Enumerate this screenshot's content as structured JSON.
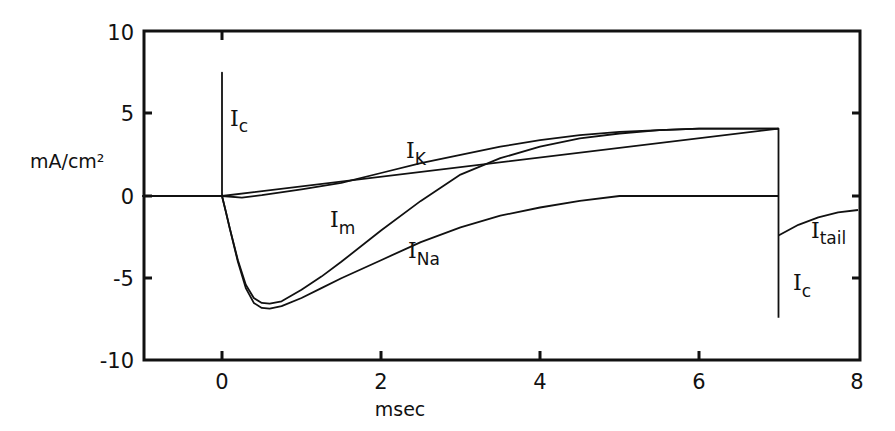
{
  "chart_data": {
    "type": "line",
    "title": "",
    "xlabel": "msec",
    "ylabel": "mA/cm²",
    "xlim": [
      -1,
      8
    ],
    "ylim": [
      -10,
      10
    ],
    "grid": false,
    "legend": "none (curves labeled inline)",
    "x_ticks": [
      0,
      2,
      4,
      6,
      8
    ],
    "x_tick_labels": [
      "0",
      "2",
      "4",
      "6",
      "8"
    ],
    "y_ticks": [
      -10,
      -5,
      0,
      5,
      10
    ],
    "y_tick_labels": [
      "-10",
      "-5",
      "0",
      "5",
      "10"
    ],
    "series": [
      {
        "name": "I_K",
        "label_main": "I",
        "label_sub": "K",
        "x": [
          -1,
          0,
          0.25,
          0.5,
          1,
          1.5,
          2,
          2.5,
          3,
          3.5,
          4,
          4.5,
          5,
          5.5,
          6,
          7
        ],
        "values": [
          0,
          0,
          -0.1,
          0.05,
          0.4,
          0.8,
          1.4,
          2.0,
          2.5,
          3.0,
          3.4,
          3.7,
          3.9,
          4.0,
          4.1,
          4.1
        ]
      },
      {
        "name": "I_Na",
        "label_main": "I",
        "label_sub": "Na",
        "x": [
          -1,
          0,
          0.05,
          0.1,
          0.2,
          0.3,
          0.4,
          0.5,
          0.6,
          0.75,
          1,
          1.25,
          1.5,
          2,
          2.5,
          3,
          3.5,
          4,
          4.5,
          5,
          6,
          7
        ],
        "values": [
          0,
          0,
          -1.0,
          -2.0,
          -4.0,
          -5.6,
          -6.5,
          -6.8,
          -6.85,
          -6.7,
          -6.2,
          -5.6,
          -5.0,
          -3.9,
          -2.8,
          -1.9,
          -1.2,
          -0.7,
          -0.3,
          0,
          0,
          0
        ]
      },
      {
        "name": "I_m",
        "label_main": "I",
        "label_sub": "m",
        "x": [
          -1,
          0,
          0.05,
          0.1,
          0.2,
          0.3,
          0.4,
          0.5,
          0.6,
          0.75,
          1,
          1.25,
          1.5,
          2,
          2.5,
          3,
          3.5,
          4,
          4.5,
          5,
          5.5,
          6,
          7
        ],
        "values": [
          0,
          0,
          -1.0,
          -2.0,
          -3.9,
          -5.4,
          -6.2,
          -6.5,
          -6.55,
          -6.4,
          -5.7,
          -4.9,
          -4.0,
          -2.1,
          -0.3,
          1.3,
          2.3,
          3.0,
          3.5,
          3.8,
          4.0,
          4.1,
          4.1
        ]
      },
      {
        "name": "I_c",
        "label_main": "I",
        "label_sub": "c",
        "x": [
          0,
          0,
          0,
          7,
          7
        ],
        "values": [
          0,
          7.5,
          0,
          4.1,
          -7.4
        ],
        "note": "capacitive transients: upward spike to ~7.5 at t=0, downward spike to ~-7.4 at t=7"
      },
      {
        "name": "I_tail",
        "label_main": "I",
        "label_sub": "tail",
        "x": [
          7,
          7.25,
          7.5,
          7.75,
          8
        ],
        "values": [
          -2.4,
          -1.75,
          -1.3,
          -1.0,
          -0.85
        ]
      }
    ],
    "annotations": [
      {
        "text": "I_c",
        "near": [
          0.15,
          4.6
        ]
      },
      {
        "text": "I_K",
        "near": [
          2.1,
          2.3
        ]
      },
      {
        "text": "I_m",
        "near": [
          1.4,
          -1.6
        ]
      },
      {
        "text": "I_Na",
        "near": [
          2.3,
          -3.5
        ]
      },
      {
        "text": "I_tail",
        "near": [
          7.5,
          -1.6
        ]
      },
      {
        "text": "I_c",
        "near": [
          7.2,
          -5.9
        ]
      }
    ]
  },
  "axes": {
    "x_title": "msec",
    "y_title": "mA/cm²",
    "x_tick_labels": [
      "0",
      "2",
      "4",
      "6",
      "8"
    ],
    "y_tick_labels": [
      "10",
      "5",
      "0",
      "-5",
      "-10"
    ]
  },
  "labels": {
    "ic_top": {
      "main": "I",
      "sub": "c"
    },
    "ik": {
      "main": "I",
      "sub": "K"
    },
    "im": {
      "main": "I",
      "sub": "m"
    },
    "ina": {
      "main": "I",
      "sub": "Na"
    },
    "itail": {
      "main": "I",
      "sub": "tail"
    },
    "ic_bottom": {
      "main": "I",
      "sub": "c"
    }
  },
  "colors": {
    "ink": "#111111",
    "background": "#ffffff"
  }
}
